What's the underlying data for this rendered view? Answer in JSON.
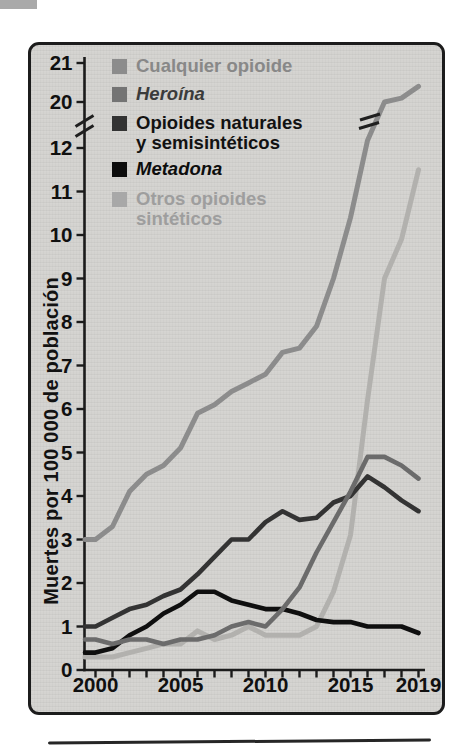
{
  "figure": {
    "page_bg": "#ffffff",
    "panel_bg": "#d4d3d0",
    "panel_border": "#1c1c1c",
    "corner_fragment_color": "#a9a9a9",
    "bottom_rule_color": "#262626",
    "axis_color": "#1b1b1b",
    "tick_text_color": "#101010",
    "break_mark_color": "#1f1f1f"
  },
  "y_axis": {
    "title": "Muertes por 100 000 de población",
    "tick_labels": [
      "21",
      "20",
      "12",
      "11",
      "10",
      "9",
      "8",
      "7",
      "6",
      "5",
      "4",
      "3",
      "2",
      "1",
      "0"
    ],
    "tick_values": [
      21,
      20,
      12,
      11,
      10,
      9,
      8,
      7,
      6,
      5,
      4,
      3,
      2,
      1,
      0
    ],
    "break_between": [
      12,
      20
    ]
  },
  "x_axis": {
    "tick_years": [
      2000,
      2001,
      2002,
      2003,
      2004,
      2005,
      2006,
      2007,
      2008,
      2009,
      2010,
      2011,
      2012,
      2013,
      2014,
      2015,
      2016,
      2017,
      2018,
      2019
    ],
    "labeled_years": [
      2000,
      2005,
      2010,
      2015,
      2019
    ],
    "labels": [
      "2000",
      "2005",
      "2010",
      "2015",
      "2019"
    ]
  },
  "legend": {
    "items": [
      {
        "line1": "Cualquier opioide",
        "line2": "",
        "color": "#8c8c8c",
        "text_color": "#888888",
        "italic": false
      },
      {
        "line1": "Heroína",
        "line2": "",
        "color": "#747474",
        "text_color": "#3b3b3b",
        "italic": true
      },
      {
        "line1": "Opioides naturales",
        "line2": "y semisintéticos",
        "color": "#333333",
        "text_color": "#121212",
        "italic": false
      },
      {
        "line1": "Metadona",
        "line2": "",
        "color": "#0d0d0d",
        "text_color": "#0d0d0d",
        "italic": true
      },
      {
        "line1": "Otros opioides",
        "line2": "sintéticos",
        "color": "#a8a8a8",
        "text_color": "#9e9e9e",
        "italic": false
      }
    ]
  },
  "chart_data": {
    "type": "line",
    "title": "",
    "xlabel": "",
    "ylabel": "Muertes por 100 000 de población",
    "ylim": [
      0,
      21
    ],
    "y_axis_break": [
      12,
      20
    ],
    "grid": false,
    "legend_position": "top-left",
    "x": [
      2000,
      2001,
      2002,
      2003,
      2004,
      2005,
      2006,
      2007,
      2008,
      2009,
      2010,
      2011,
      2012,
      2013,
      2014,
      2015,
      2016,
      2017,
      2018,
      2019
    ],
    "series": [
      {
        "name": "Cualquier opioide",
        "color": "#8c8c8c",
        "values": [
          3.0,
          3.3,
          4.1,
          4.5,
          4.7,
          5.1,
          5.9,
          6.1,
          6.4,
          6.6,
          6.8,
          7.3,
          7.4,
          7.9,
          9.0,
          10.4,
          13.3,
          20.0,
          20.1,
          20.4
        ]
      },
      {
        "name": "Heroína",
        "color": "#6b6b6b",
        "values": [
          0.7,
          0.6,
          0.7,
          0.7,
          0.6,
          0.7,
          0.7,
          0.8,
          1.0,
          1.1,
          1.0,
          1.4,
          1.9,
          2.7,
          3.4,
          4.1,
          4.9,
          4.9,
          4.7,
          4.4
        ]
      },
      {
        "name": "Opioides naturales y semisintéticos",
        "color": "#333333",
        "values": [
          1.0,
          1.2,
          1.4,
          1.5,
          1.7,
          1.85,
          2.2,
          2.6,
          3.0,
          3.0,
          3.4,
          3.65,
          3.45,
          3.5,
          3.85,
          4.0,
          4.45,
          4.2,
          3.9,
          3.65
        ]
      },
      {
        "name": "Metadona",
        "color": "#0f0f0f",
        "values": [
          0.4,
          0.5,
          0.8,
          1.0,
          1.3,
          1.5,
          1.8,
          1.8,
          1.6,
          1.5,
          1.4,
          1.4,
          1.3,
          1.15,
          1.1,
          1.1,
          1.0,
          1.0,
          1.0,
          0.85
        ]
      },
      {
        "name": "Otros opioides sintéticos",
        "color": "#b2b1ae",
        "values": [
          0.3,
          0.3,
          0.4,
          0.5,
          0.6,
          0.6,
          0.9,
          0.7,
          0.8,
          1.0,
          0.8,
          0.8,
          0.8,
          1.0,
          1.8,
          3.1,
          6.2,
          9.0,
          9.9,
          11.5
        ]
      }
    ]
  }
}
